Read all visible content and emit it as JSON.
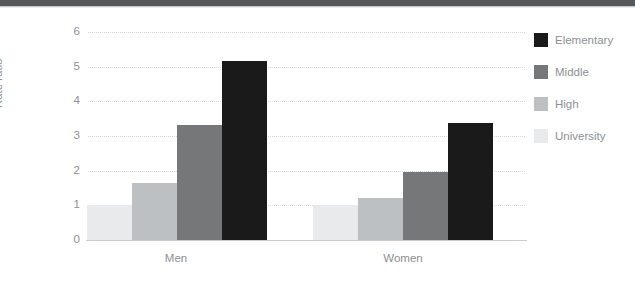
{
  "chart_data": {
    "type": "bar",
    "title": "",
    "subtitle": "",
    "xlabel": "",
    "ylabel": "Rate ratio",
    "categories": [
      "Men",
      "Women"
    ],
    "ylim": [
      0,
      6
    ],
    "yticks": [
      0,
      1,
      2,
      3,
      4,
      5,
      6
    ],
    "ytick_labels": [
      "0",
      "1",
      "2",
      "3",
      "4",
      "5",
      "6"
    ],
    "grid": "horizontal-dotted",
    "legend_position": "right",
    "series": [
      {
        "name": "Elementary",
        "color": "#1a1a1a",
        "values": [
          5.15,
          3.38
        ]
      },
      {
        "name": "Middle",
        "color": "#757779",
        "values": [
          3.32,
          1.97
        ]
      },
      {
        "name": "High",
        "color": "#bdc0c2",
        "values": [
          1.65,
          1.2
        ]
      },
      {
        "name": "University",
        "color": "#e9eaeb",
        "values": [
          1.0,
          1.0
        ]
      }
    ],
    "bar_order_in_group": [
      "University",
      "High",
      "Middle",
      "Elementary"
    ],
    "annotations": []
  },
  "axes": {
    "y_axis_label": "Rate ratio",
    "tick_0": "0",
    "tick_1": "1",
    "tick_2": "2",
    "tick_3": "3",
    "tick_4": "4",
    "tick_5": "5",
    "tick_6": "6",
    "cat_men": "Men",
    "cat_women": "Women"
  },
  "legend": {
    "items": [
      {
        "label": "Elementary",
        "color": "#1a1a1a"
      },
      {
        "label": "Middle",
        "color": "#757779"
      },
      {
        "label": "High",
        "color": "#bdc0c2"
      },
      {
        "label": "University",
        "color": "#e9eaeb"
      }
    ]
  },
  "colors": {
    "top_band": "#555759",
    "gridline": "#d6d9dc",
    "baseline": "#c9ccd0",
    "text": "#8d9094",
    "background": "#ffffff"
  }
}
